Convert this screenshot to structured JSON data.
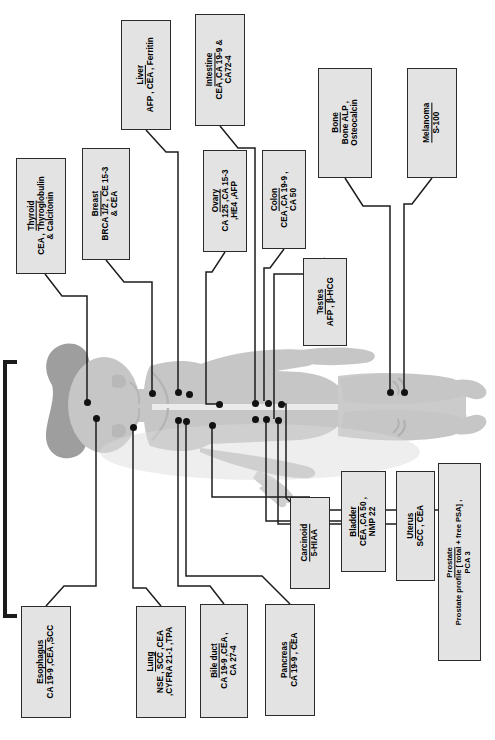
{
  "diagram": {
    "orientation": "labels rotated 90 degrees counter-clockwise",
    "box_fill": "#e3e3e3",
    "box_border": "#2b2b2b",
    "marker_dot_color": "#111111",
    "silhouette_color": "#c9c9c9"
  },
  "labels": [
    {
      "id": "thyroid",
      "title": "Thyroid",
      "markers": "CEA , Thyroglobulin\n& Calcitonin",
      "x": 16,
      "y": 158,
      "w": 50,
      "h": 116,
      "size": "s8"
    },
    {
      "id": "breast",
      "title": "Breast",
      "markers": "BRCA 1/2 , CE 15-3\n& CEA",
      "x": 82,
      "y": 148,
      "w": 48,
      "h": 112,
      "size": "s8"
    },
    {
      "id": "liver",
      "title": "Liver",
      "markers": "AFP , CEA , Ferritin",
      "x": 121,
      "y": 20,
      "w": 50,
      "h": 110,
      "size": "s8"
    },
    {
      "id": "intestine",
      "title": "Intestine",
      "markers": "CEA ,CA 19-9 &\nCA72-4",
      "x": 195,
      "y": 14,
      "w": 50,
      "h": 112,
      "size": "s8"
    },
    {
      "id": "ovary",
      "title": "Ovary",
      "markers": "CA 125 ,CA 15-3\n,HE4 ,AFP",
      "x": 203,
      "y": 150,
      "w": 44,
      "h": 102,
      "size": "s8"
    },
    {
      "id": "colon",
      "title": "Colon",
      "markers": "CEA ,CA 19-9 ,\nCA 50",
      "x": 262,
      "y": 150,
      "w": 44,
      "h": 99,
      "size": "s8"
    },
    {
      "id": "testes",
      "title": "Testes",
      "markers": "AFP , β-HCG",
      "x": 303,
      "y": 258,
      "w": 44,
      "h": 88,
      "size": "s8"
    },
    {
      "id": "bone",
      "title": "Bone",
      "markers": "Bone ALP ,\nOsteocalcin",
      "x": 318,
      "y": 68,
      "w": 54,
      "h": 110,
      "size": "s8"
    },
    {
      "id": "melanoma",
      "title": "Melanoma",
      "markers": "S-100",
      "x": 407,
      "y": 68,
      "w": 50,
      "h": 110,
      "size": "s8"
    },
    {
      "id": "esophagus",
      "title": "Esophagus",
      "markers": "CA 19-9 ,CEA ,SCC",
      "x": 21,
      "y": 606,
      "w": 50,
      "h": 112,
      "size": "s8"
    },
    {
      "id": "lung",
      "title": "Lung",
      "markers": "NSE , SCC ,CEA\n,CYFRA 21-1 ,TPA",
      "x": 136,
      "y": 606,
      "w": 50,
      "h": 112,
      "size": "s8"
    },
    {
      "id": "bile-duct",
      "title": "Bile duct",
      "markers": "CA 19-9 ,CEA ,\nCA 27-4",
      "x": 200,
      "y": 604,
      "w": 48,
      "h": 114,
      "size": "s8"
    },
    {
      "id": "pancreas",
      "title": "Pancreas",
      "markers": "CA 19-9 , CEA",
      "x": 265,
      "y": 604,
      "w": 50,
      "h": 112,
      "size": "s8"
    },
    {
      "id": "carcinoid",
      "title": "Carcinoid",
      "markers": "5-HIAA",
      "x": 290,
      "y": 497,
      "w": 40,
      "h": 92,
      "size": "s8"
    },
    {
      "id": "bladder",
      "title": "Bladder",
      "markers": "CEA ,CA 50 ,\nNMP 22",
      "x": 341,
      "y": 471,
      "w": 45,
      "h": 101,
      "size": "s8"
    },
    {
      "id": "uterus",
      "title": "Uterus",
      "markers": "SCC , CEA",
      "x": 396,
      "y": 471,
      "w": 39,
      "h": 110,
      "size": "s8"
    },
    {
      "id": "prostate",
      "title": "Prostate",
      "markers": "Prostate profile [ total + free PSA] ,\nPCA 3",
      "x": 438,
      "y": 463,
      "w": 43,
      "h": 198,
      "size": "s7"
    }
  ],
  "marker_dots": [
    {
      "id": "dot-thyroid",
      "x": 87,
      "y": 402
    },
    {
      "id": "dot-esophagus",
      "x": 96,
      "y": 418
    },
    {
      "id": "dot-breast",
      "x": 152,
      "y": 393
    },
    {
      "id": "dot-lung",
      "x": 133,
      "y": 427
    },
    {
      "id": "dot-liver",
      "x": 178,
      "y": 392
    },
    {
      "id": "dot-liver-2",
      "x": 189,
      "y": 394
    },
    {
      "id": "dot-bileduct",
      "x": 178,
      "y": 420
    },
    {
      "id": "dot-pancreas",
      "x": 186,
      "y": 421
    },
    {
      "id": "dot-carcinoid",
      "x": 212,
      "y": 425
    },
    {
      "id": "dot-intestine",
      "x": 255,
      "y": 403
    },
    {
      "id": "dot-colon",
      "x": 268,
      "y": 403
    },
    {
      "id": "dot-testes",
      "x": 255,
      "y": 419
    },
    {
      "id": "dot-bladder",
      "x": 266,
      "y": 419
    },
    {
      "id": "dot-uterus",
      "x": 278,
      "y": 420
    },
    {
      "id": "dot-prostate",
      "x": 281,
      "y": 404
    },
    {
      "id": "dot-ovary",
      "x": 219,
      "y": 404
    },
    {
      "id": "dot-bone",
      "x": 390,
      "y": 392
    },
    {
      "id": "dot-melanoma",
      "x": 404,
      "y": 392
    }
  ]
}
